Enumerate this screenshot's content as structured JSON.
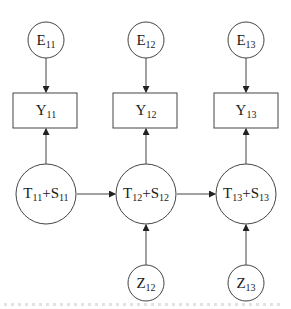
{
  "diagram": {
    "type": "path-diagram",
    "columns": [
      {
        "error": {
          "base": "E",
          "sub": "11"
        },
        "observed": {
          "base": "Y",
          "sub": "11"
        },
        "latent": {
          "t_base": "T",
          "t_sub": "11",
          "plus": "+",
          "s_base": "S",
          "s_sub": "11"
        },
        "covariate": null
      },
      {
        "error": {
          "base": "E",
          "sub": "12"
        },
        "observed": {
          "base": "Y",
          "sub": "12"
        },
        "latent": {
          "t_base": "T",
          "t_sub": "12",
          "plus": "+",
          "s_base": "S",
          "s_sub": "12"
        },
        "covariate": {
          "base": "Z",
          "sub": "12"
        }
      },
      {
        "error": {
          "base": "E",
          "sub": "13"
        },
        "observed": {
          "base": "Y",
          "sub": "13"
        },
        "latent": {
          "t_base": "T",
          "t_sub": "13",
          "plus": "+",
          "s_base": "S",
          "s_sub": "13"
        },
        "covariate": {
          "base": "Z",
          "sub": "13"
        }
      }
    ],
    "edges": [
      {
        "from": "E11",
        "to": "Y11"
      },
      {
        "from": "E12",
        "to": "Y12"
      },
      {
        "from": "E13",
        "to": "Y13"
      },
      {
        "from": "T11+S11",
        "to": "Y11"
      },
      {
        "from": "T12+S12",
        "to": "Y12"
      },
      {
        "from": "T13+S13",
        "to": "Y13"
      },
      {
        "from": "T11+S11",
        "to": "T12+S12"
      },
      {
        "from": "T12+S12",
        "to": "T13+S13"
      },
      {
        "from": "Z12",
        "to": "T12+S12"
      },
      {
        "from": "Z13",
        "to": "T13+S13"
      }
    ],
    "colors": {
      "stroke": "#333333",
      "background": "#ffffff"
    }
  }
}
